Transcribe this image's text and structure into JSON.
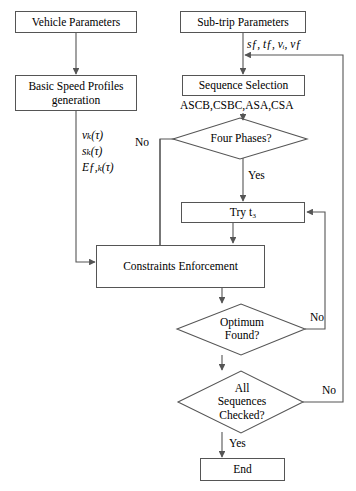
{
  "diagram": {
    "stroke_color": "#555555",
    "text_color": "#000000",
    "background": "#ffffff"
  },
  "nodes": {
    "vehicle_parameters": "Vehicle Parameters",
    "subtrip_parameters": "Sub-trip Parameters",
    "basic_speed_profiles": "Basic Speed Profiles generation",
    "sequence_selection": "Sequence Selection",
    "four_phases": "Four Phases?",
    "try_t3": "Try t₃",
    "constraints_enforcement": "Constraints Enforcement",
    "optimum_found": "Optimum Found?",
    "all_sequences_checked": "All Sequences Checked?",
    "end": "End"
  },
  "annotations": {
    "subtrip_vars": "sƒ, tƒ, vᵢ, vƒ",
    "sequence_list": "ASCB,CSBC,ASA,CSA",
    "profile_vars_line1": "vₖ(τ)",
    "profile_vars_line2": "sₖ(τ)",
    "profile_vars_line3": "Eƒ,ₖ(τ)"
  },
  "edge_labels": {
    "four_phases_no": "No",
    "four_phases_yes": "Yes",
    "optimum_found_no": "No",
    "all_sequences_no": "No",
    "all_sequences_yes": "Yes"
  }
}
